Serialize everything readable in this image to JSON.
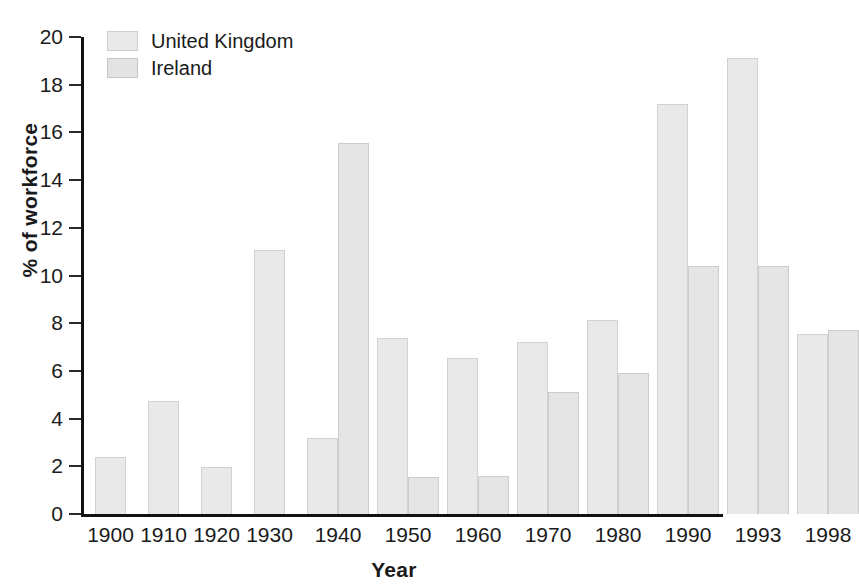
{
  "chart_data": {
    "type": "bar",
    "title": "",
    "xlabel": "Year",
    "ylabel": "% of workforce",
    "ylim": [
      0,
      20
    ],
    "ytick_step": 2,
    "yticks": [
      0,
      2,
      4,
      6,
      8,
      10,
      12,
      14,
      16,
      18,
      20
    ],
    "grid": false,
    "legend_position": "top-left",
    "categories": [
      "1900",
      "1910",
      "1920",
      "1930",
      "1940",
      "1950",
      "1960",
      "1970",
      "1980",
      "1990",
      "1993",
      "1998"
    ],
    "series": [
      {
        "name": "United Kingdom",
        "color": "#e9e9e9",
        "values": [
          2.4,
          4.75,
          1.95,
          11.05,
          3.2,
          7.4,
          6.55,
          7.2,
          8.15,
          17.2,
          19.1,
          7.55
        ]
      },
      {
        "name": "Ireland",
        "color": "#e5e5e5",
        "values": [
          null,
          null,
          null,
          null,
          15.55,
          1.55,
          1.6,
          5.1,
          5.9,
          10.4,
          10.4,
          7.7
        ]
      }
    ]
  },
  "axes": {
    "y_title": "% of workforce",
    "x_title": "Year",
    "y_tick_labels": [
      "0",
      "2",
      "4",
      "6",
      "8",
      "10",
      "12",
      "14",
      "16",
      "18",
      "20"
    ],
    "x_tick_labels": [
      "1900",
      "1910",
      "1920",
      "1930",
      "1940",
      "1950",
      "1960",
      "1970",
      "1980",
      "1990",
      "1993",
      "1998"
    ]
  },
  "legend": {
    "items": [
      {
        "label": "United Kingdom",
        "swatch": "uk-swatch"
      },
      {
        "label": "Ireland",
        "swatch": "ireland-swatch"
      }
    ]
  }
}
